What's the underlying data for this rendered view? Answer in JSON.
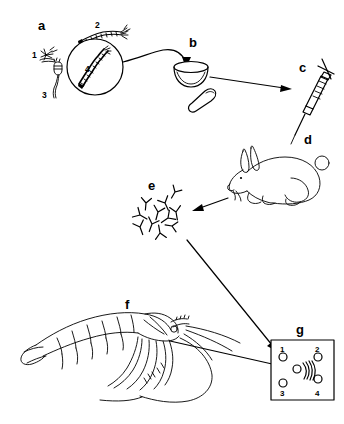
{
  "figure": {
    "background_color": "#ffffff",
    "ink_color": "#000000",
    "width": 344,
    "height": 424
  },
  "panels": [
    {
      "id": "a",
      "label": "a",
      "name": "parasite-sample-panel",
      "description": "Parasite specimens with magnifying circle",
      "items": [
        {
          "num": "1",
          "name": "spiky-organism",
          "description": "small star-shaped spiky organism"
        },
        {
          "num": "2",
          "name": "segmented-worm",
          "description": "segmented worm with branched head"
        },
        {
          "num": "3",
          "name": "cercaria-larva",
          "description": "tadpole-shaped larva with tail"
        },
        {
          "num": "4",
          "name": "magnified-worm",
          "description": "magnified segmented worm inside circle"
        }
      ]
    },
    {
      "id": "b",
      "label": "b",
      "name": "mortar-and-pestle",
      "description": "Mortar bowl with pestle for grinding antigen"
    },
    {
      "id": "c",
      "label": "c",
      "name": "syringe",
      "description": "Syringe with graduated barrel and needle"
    },
    {
      "id": "d",
      "label": "d",
      "name": "rabbit",
      "description": "Rabbit injected to raise antiserum"
    },
    {
      "id": "e",
      "label": "e",
      "name": "antibody-cluster",
      "description": "Cluster of Y-shaped antibodies"
    },
    {
      "id": "f",
      "label": "f",
      "name": "shrimp",
      "description": "Shrimp / prawn specimen with segmented body, legs and antennae"
    },
    {
      "id": "g",
      "label": "g",
      "name": "immunodiffusion-plate",
      "description": "Ouchterlony double immunodiffusion plate",
      "wells": [
        {
          "num": "1",
          "name": "well-1",
          "position": "top-left"
        },
        {
          "num": "2",
          "name": "well-2",
          "position": "top-right"
        },
        {
          "num": "3",
          "name": "well-3",
          "position": "bottom-left"
        },
        {
          "num": "4",
          "name": "well-4",
          "position": "bottom-right"
        },
        {
          "num": "",
          "name": "well-center",
          "position": "center"
        }
      ],
      "precipitin_lines": 4
    }
  ],
  "arrows": [
    {
      "name": "arrow-a-to-b",
      "from": "a",
      "to": "b",
      "style": "curved"
    },
    {
      "name": "arrow-b-to-c",
      "from": "b",
      "to": "c",
      "style": "straight"
    },
    {
      "name": "arrow-d-to-e",
      "from": "d",
      "to": "e",
      "style": "straight"
    },
    {
      "name": "arrow-e-to-g",
      "from": "e",
      "to": "g",
      "style": "straight"
    },
    {
      "name": "arrow-f-to-g",
      "from": "f",
      "to": "g",
      "style": "straight"
    }
  ]
}
